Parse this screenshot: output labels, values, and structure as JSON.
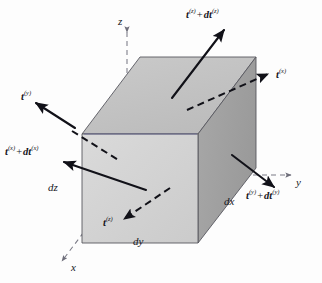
{
  "axes": {
    "z": {
      "label": "z",
      "x": 118,
      "y": 22
    },
    "y": {
      "label": "y",
      "x": 297,
      "y": 176
    },
    "x": {
      "label": "x",
      "x": 72,
      "y": 267
    }
  },
  "dimensions": [
    {
      "name": "dz",
      "label": "dz",
      "x": 50,
      "y": 183
    },
    {
      "name": "dy",
      "label": "dy",
      "x": 135,
      "y": 238
    },
    {
      "name": "dx",
      "label": "dx",
      "x": 226,
      "y": 197
    }
  ],
  "tractions": [
    {
      "name": "t-z-plus-dt-z",
      "base": "t",
      "sup": "(z)",
      "increment": "dt",
      "incsup": "(z)",
      "full": "t(z) + dt(z)",
      "x": 186,
      "y": 9,
      "style": "solid",
      "face": "top"
    },
    {
      "name": "t-x",
      "base": "t",
      "sup": "(x)",
      "full": "t(x)",
      "x": 276,
      "y": 70,
      "style": "dashed",
      "face": "back-x"
    },
    {
      "name": "t-y",
      "base": "t",
      "sup": "(y)",
      "full": "t(y)",
      "x": 21,
      "y": 92,
      "style": "solid",
      "face": "left"
    },
    {
      "name": "t-x-plus-dt-x",
      "base": "t",
      "sup": "(x)",
      "increment": "dt",
      "incsup": "(x)",
      "full": "t(x) + dt(x)",
      "x": 5,
      "y": 147,
      "style": "solid",
      "face": "front-x"
    },
    {
      "name": "t-y-plus-dt-y",
      "base": "t",
      "sup": "(y)",
      "increment": "dt",
      "incsup": "(y)",
      "full": "t(y) + dt(y)",
      "x": 248,
      "y": 190,
      "style": "solid",
      "face": "right"
    },
    {
      "name": "t-z",
      "base": "t",
      "sup": "(z)",
      "full": "t(z)",
      "x": 104,
      "y": 218,
      "style": "dashed",
      "face": "bottom"
    }
  ],
  "colors": {
    "face_front": "#d2d2d2",
    "face_top": "#c0c0c0",
    "face_right": "#a0a0a0",
    "outline": "#4a4a52",
    "axis_dash": "#7a7a86",
    "arrow": "#111118",
    "highlight_edge": "#5f5f9c",
    "background": "#fdfdfd",
    "text": "#15151c"
  },
  "geometry": {
    "front_face": "82,134 198,134 198,243 82,243",
    "top_face": "82,134 140,57 256,57 198,134",
    "right_face": "198,134 256,57 256,168 198,243"
  }
}
